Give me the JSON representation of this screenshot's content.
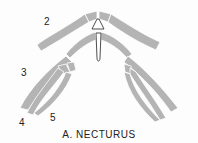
{
  "figure": {
    "caption": "A. NECTURUS",
    "labels": {
      "arch2": "2",
      "arch3": "3",
      "arch4": "4",
      "arch5": "5"
    },
    "colors": {
      "cartilage": "#b4b4b4",
      "outline": "#ffffff",
      "text": "#222222",
      "background": "#fdfdfd"
    }
  }
}
